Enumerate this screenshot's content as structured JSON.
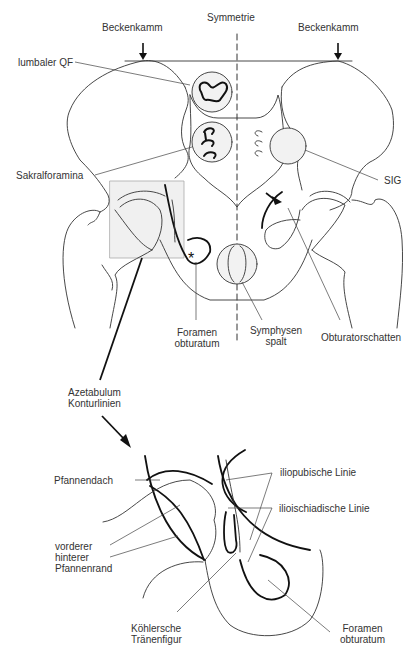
{
  "figure": {
    "top_panel": {
      "name": "pelvis-ap-overview",
      "labels": {
        "iliac_crest_left": "Beckenkamm",
        "iliac_crest_right": "Beckenkamm",
        "symmetry": "Symmetrie",
        "lumbar_qf": "lumbaler QF",
        "sacral_foramina": "Sakralforamina",
        "sig": "SIG",
        "foramen_obturatum_line1": "Foramen",
        "foramen_obturatum_line2": "obturatum",
        "symphysis_line1": "Symphysen",
        "symphysis_line2": "spalt",
        "obturator_shadow": "Obturatorschatten"
      },
      "markers": {
        "star": "*"
      }
    },
    "connector": {
      "label_line1": "Azetabulum",
      "label_line2": "Konturlinien"
    },
    "bottom_panel": {
      "name": "acetabulum-contour-detail",
      "labels": {
        "acetabular_roof": "Pfannendach",
        "iliopubic_line": "iliopubische Linie",
        "ilioischial_line": "ilioischiadische Linie",
        "rim_line1": "vorderer",
        "rim_line2": "hinterer",
        "rim_line3": "Pfannenrand",
        "teardrop_line1": "Köhlersche",
        "teardrop_line2": "Tränenfigur",
        "foramen_line1": "Foramen",
        "foramen_line2": "obturatum"
      }
    },
    "colors": {
      "line": "#222222",
      "thin_line": "#333333",
      "highlight_fill": "#eeeeee",
      "box_stroke": "#aaaaaa",
      "text": "#333333"
    }
  }
}
